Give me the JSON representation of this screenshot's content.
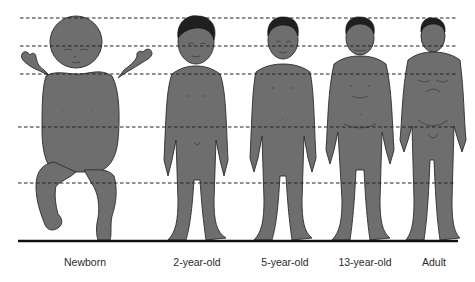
{
  "figure": {
    "type": "body-proportion-comparison",
    "reference_lines": {
      "style": "dashed",
      "count": 5,
      "y_positions": [
        18,
        46,
        74,
        127,
        183
      ]
    },
    "ground_line": {
      "style": "solid",
      "y": 241
    },
    "colors": {
      "figure_fill": "#6e6e6e",
      "outline": "#2b2b2b",
      "hair": "#1f1f1f",
      "lines": "#222222",
      "background": "#ffffff"
    },
    "stages": [
      {
        "id": "newborn",
        "label": "Newborn",
        "center_x": 85
      },
      {
        "id": "2-year-old",
        "label": "2-year-old",
        "center_x": 196
      },
      {
        "id": "5-year-old",
        "label": "5-year-old",
        "center_x": 285
      },
      {
        "id": "13-year-old",
        "label": "13-year-old",
        "center_x": 366
      },
      {
        "id": "adult",
        "label": "Adult",
        "center_x": 434
      }
    ]
  }
}
